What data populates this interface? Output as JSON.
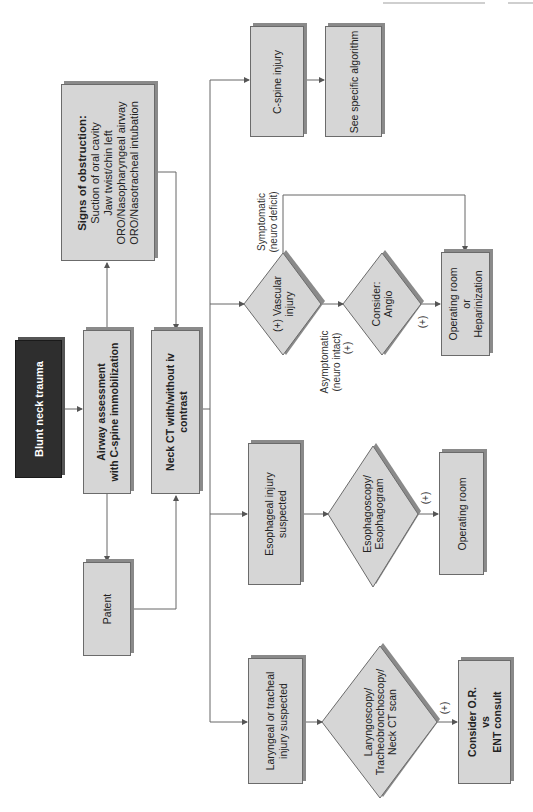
{
  "diagram": {
    "title": "Blunt neck trauma",
    "nodes": {
      "start": "Blunt neck trauma",
      "airway": [
        "Airway assessment",
        "with C-spine immobilization"
      ],
      "neck_ct": [
        "Neck CT with/without iv",
        "contrast"
      ],
      "obstruction": {
        "heading": "Signs of obstruction:",
        "items": [
          "Suction of oral cavity",
          "Jaw twist/chin left",
          "ORO/Nasopharyngeal airway",
          "ORO/Nasotracheal intubation"
        ]
      },
      "patent": "Patent",
      "cspine": "C-spine injury",
      "see_algorithm": "See specific algorithm",
      "vascular": [
        "(+) Vascular",
        "injury"
      ],
      "angio": [
        "Consider:",
        "Angio"
      ],
      "or_heparin": [
        "Operating room",
        "or",
        "Heparinization"
      ],
      "esophageal": [
        "Esophageal injury",
        "suspected"
      ],
      "esophagoscopy": [
        "Esophagoscopy/",
        "Esophagogram"
      ],
      "or_esoph": "Operating room",
      "laryngeal": [
        "Laryngeal or tracheal",
        "injury suspected"
      ],
      "laryngoscopy": [
        "Laryngoscopy/",
        "Tracheobronchoscopy/",
        "Neck CT scan"
      ],
      "ent": [
        "Consider O.R.",
        "vs",
        "ENT consult"
      ]
    },
    "edge_labels": {
      "symptomatic": [
        "Symptomatic",
        "(neuro deficit)"
      ],
      "asymptomatic": [
        "Asymptomatic",
        "(neuro intact)"
      ],
      "plus_asym": "(+)",
      "plus_angio": "(+)",
      "plus_esoph": "(+)",
      "plus_laryng": "(+)"
    },
    "colors": {
      "box_fill": "#d6d6d6",
      "start_fill": "#2e2e2e",
      "line": "#6b6b6b"
    }
  }
}
